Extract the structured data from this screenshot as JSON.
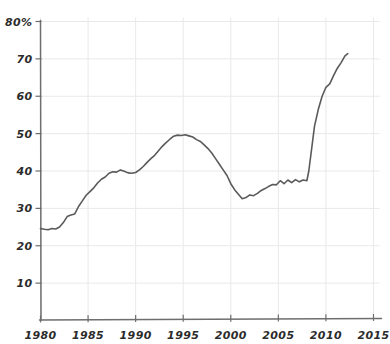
{
  "chart_data": {
    "type": "line",
    "title": "",
    "xlabel": "",
    "ylabel": "",
    "xlim": [
      1980,
      2015
    ],
    "ylim": [
      0,
      80
    ],
    "grid": true,
    "legend": "none",
    "y_unit_suffix": "%",
    "x_ticks": [
      "1980",
      "1985",
      "1990",
      "1995",
      "2000",
      "2005",
      "2010",
      "2015"
    ],
    "x_tick_values": [
      1980,
      1985,
      1990,
      1995,
      2000,
      2005,
      2010,
      2015
    ],
    "y_ticks": [
      "10",
      "20",
      "30",
      "40",
      "50",
      "60",
      "70",
      "80%"
    ],
    "y_tick_values": [
      10,
      20,
      30,
      40,
      50,
      60,
      70,
      80
    ],
    "series": [
      {
        "name": "series-1",
        "color": "#5a5a5a",
        "x": [
          1980.0,
          1980.4,
          1980.8,
          1981.2,
          1981.6,
          1982.0,
          1982.4,
          1982.8,
          1983.2,
          1983.6,
          1984.0,
          1984.4,
          1984.8,
          1985.2,
          1985.6,
          1986.0,
          1986.4,
          1986.8,
          1987.2,
          1987.6,
          1988.0,
          1988.4,
          1988.8,
          1989.2,
          1989.6,
          1990.0,
          1990.4,
          1990.8,
          1991.2,
          1991.6,
          1992.0,
          1992.4,
          1992.8,
          1993.2,
          1993.6,
          1994.0,
          1994.4,
          1994.8,
          1995.2,
          1995.6,
          1996.0,
          1996.4,
          1996.8,
          1997.2,
          1997.6,
          1998.0,
          1998.4,
          1998.8,
          1999.2,
          1999.6,
          2000.0,
          2000.4,
          2000.8,
          2001.2,
          2001.6,
          2002.0,
          2002.4,
          2002.8,
          2003.2,
          2003.6,
          2004.0,
          2004.4,
          2004.8,
          2005.2,
          2005.6,
          2006.0,
          2006.4,
          2006.8,
          2007.2,
          2007.6,
          2008.0,
          2008.2,
          2008.5,
          2008.8,
          2009.2,
          2009.6,
          2010.0,
          2010.4,
          2010.8,
          2011.2,
          2011.6,
          2012.0,
          2012.3
        ],
        "y": [
          24.6,
          24.4,
          24.3,
          24.6,
          24.5,
          25.0,
          26.2,
          27.8,
          28.2,
          28.5,
          30.5,
          32.0,
          33.5,
          34.5,
          35.5,
          36.8,
          37.8,
          38.4,
          39.4,
          39.8,
          39.7,
          40.3,
          39.9,
          39.5,
          39.4,
          39.6,
          40.3,
          41.2,
          42.3,
          43.3,
          44.2,
          45.4,
          46.6,
          47.6,
          48.5,
          49.3,
          49.6,
          49.5,
          49.7,
          49.4,
          49.1,
          48.4,
          47.9,
          47.0,
          46.0,
          44.8,
          43.3,
          41.8,
          40.3,
          38.8,
          36.6,
          35.0,
          33.8,
          32.6,
          32.9,
          33.6,
          33.4,
          34.0,
          34.8,
          35.3,
          35.9,
          36.4,
          36.3,
          37.4,
          36.6,
          37.6,
          36.9,
          37.7,
          37.1,
          37.6,
          37.4,
          40.0,
          46.0,
          52.0,
          56.5,
          60.0,
          62.4,
          63.3,
          65.5,
          67.5,
          69.0,
          70.8,
          71.4
        ]
      }
    ],
    "annotations": [],
    "top_clipped_text": ""
  },
  "axes": {
    "y_axis_name": "y-axis",
    "x_axis_name": "x-axis"
  },
  "style": {
    "line_color": "#5a5a5a",
    "grid_color": "#e9e9e9",
    "axis_color": "#6e6e6e",
    "text_color": "#2b2b2b",
    "background": "#ffffff"
  }
}
